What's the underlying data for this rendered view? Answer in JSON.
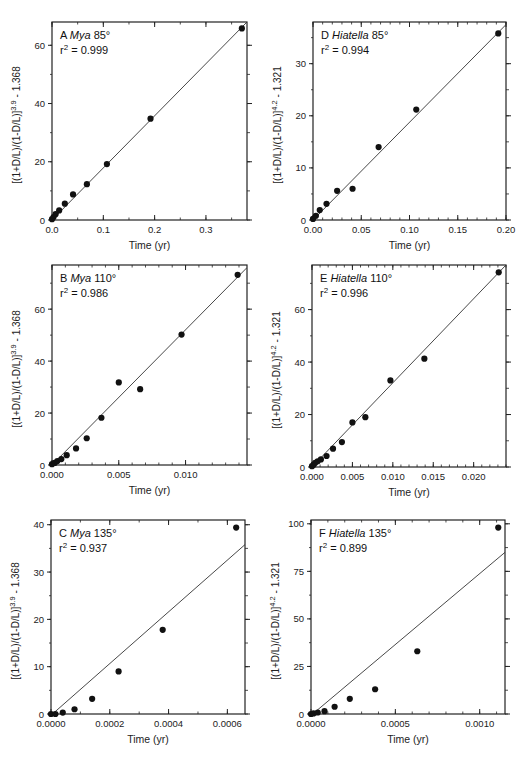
{
  "figure": {
    "x_axis_title": "Time (yr)"
  },
  "chart_data": [
    {
      "type": "scatter",
      "panel": "A",
      "taxon": "Mya",
      "temperature": "85°",
      "r2_text": "= 0.999",
      "ylabel_base": "[(1+D/L)/(1-D/L)]",
      "ylabel_exp": "3.9",
      "ylabel_tail": " - 1.368",
      "xlabel": "Time (yr)",
      "xlim": [
        0,
        0.38
      ],
      "ylim": [
        0,
        68
      ],
      "xticks": [
        0.0,
        0.1,
        0.2,
        0.3
      ],
      "xtick_labels": [
        "0.0",
        "0.1",
        "0.2",
        "0.3"
      ],
      "xminor": 0.05,
      "yticks": [
        0,
        20,
        40,
        60
      ],
      "ytick_labels": [
        "0",
        "20",
        "40",
        "60"
      ],
      "yminor": 10,
      "x": [
        0.0,
        0.003,
        0.007,
        0.014,
        0.025,
        0.041,
        0.068,
        0.107,
        0.192,
        0.37
      ],
      "y": [
        0.3,
        1.0,
        2.0,
        3.3,
        5.6,
        8.8,
        12.3,
        19.2,
        34.8,
        65.8
      ],
      "fit": {
        "x": [
          0,
          0.38
        ],
        "y": [
          0,
          68
        ]
      },
      "box": {
        "left": 52,
        "top": 22,
        "right": 247,
        "bottom": 220
      }
    },
    {
      "type": "scatter",
      "panel": "D",
      "taxon": "Hiatella",
      "temperature": "85°",
      "r2_text": "= 0.994",
      "ylabel_base": "[(1+D/L)/(1-D/L)]",
      "ylabel_exp": "4.2",
      "ylabel_tail": " - 1.321",
      "xlabel": "Time (yr)",
      "xlim": [
        0,
        0.2
      ],
      "ylim": [
        0,
        38
      ],
      "xticks": [
        0.0,
        0.05,
        0.1,
        0.15,
        0.2
      ],
      "xtick_labels": [
        "0.00",
        "0.05",
        "0.10",
        "0.15",
        "0.20"
      ],
      "xminor": 0.01,
      "yticks": [
        0,
        10,
        20,
        30
      ],
      "ytick_labels": [
        "0",
        "10",
        "20",
        "30"
      ],
      "yminor": 5,
      "x": [
        0.0,
        0.003,
        0.007,
        0.014,
        0.025,
        0.041,
        0.068,
        0.107,
        0.192
      ],
      "y": [
        0.2,
        0.8,
        1.9,
        3.1,
        5.6,
        6.0,
        14.0,
        21.2,
        35.8
      ],
      "fit": {
        "x": [
          0,
          0.2
        ],
        "y": [
          0,
          37.5
        ]
      },
      "box": {
        "left": 313,
        "top": 22,
        "right": 506,
        "bottom": 220
      }
    },
    {
      "type": "scatter",
      "panel": "B",
      "taxon": "Mya",
      "temperature": "110°",
      "r2_text": "= 0.986",
      "ylabel_base": "[(1+D/L)/(1-D/L)]",
      "ylabel_exp": "3.9",
      "ylabel_tail": " - 1.368",
      "xlabel": "Time (yr)",
      "xlim": [
        0,
        0.0146
      ],
      "ylim": [
        0,
        77
      ],
      "xticks": [
        0.0,
        0.005,
        0.01
      ],
      "xtick_labels": [
        "0.000",
        "0.005",
        "0.010"
      ],
      "xminor": 0.001,
      "yticks": [
        0,
        20,
        40,
        60
      ],
      "ytick_labels": [
        "0",
        "20",
        "40",
        "60"
      ],
      "yminor": 10,
      "x": [
        0.0,
        0.0002,
        0.0004,
        0.0007,
        0.0011,
        0.0018,
        0.0026,
        0.0037,
        0.005,
        0.0066,
        0.0097,
        0.0139
      ],
      "y": [
        0.3,
        0.8,
        1.5,
        2.3,
        3.8,
        6.4,
        10.3,
        18.2,
        31.8,
        29.2,
        50.2,
        73.2
      ],
      "fit": {
        "x": [
          0,
          0.0146
        ],
        "y": [
          0,
          76
        ]
      },
      "box": {
        "left": 52,
        "top": 265,
        "right": 247,
        "bottom": 465
      }
    },
    {
      "type": "scatter",
      "panel": "E",
      "taxon": "Hiatella",
      "temperature": "110°",
      "r2_text": "= 0.996",
      "ylabel_base": "[(1+D/L)/(1-D/L)]",
      "ylabel_exp": "4.2",
      "ylabel_tail": " - 1.321",
      "xlabel": "Time (yr)",
      "xlim": [
        0,
        0.024
      ],
      "ylim": [
        0,
        77
      ],
      "xticks": [
        0.0,
        0.005,
        0.01,
        0.015,
        0.02
      ],
      "xtick_labels": [
        "0.000",
        "0.005",
        "0.010",
        "0.015",
        "0.020"
      ],
      "xminor": 0.001,
      "yticks": [
        0,
        20,
        40,
        60
      ],
      "ytick_labels": [
        "0",
        "20",
        "40",
        "60"
      ],
      "yminor": 10,
      "x": [
        0.0,
        0.0002,
        0.0004,
        0.0007,
        0.0011,
        0.0018,
        0.0026,
        0.0037,
        0.005,
        0.0066,
        0.0097,
        0.0139,
        0.0231
      ],
      "y": [
        0.3,
        0.9,
        1.6,
        2.2,
        2.9,
        4.2,
        7.0,
        9.5,
        17.0,
        19.0,
        33.0,
        41.3,
        74.2
      ],
      "fit": {
        "x": [
          0,
          0.024
        ],
        "y": [
          0,
          77
        ]
      },
      "box": {
        "left": 312,
        "top": 265,
        "right": 506,
        "bottom": 467
      }
    },
    {
      "type": "scatter",
      "panel": "C",
      "taxon": "Mya",
      "temperature": "135°",
      "r2_text": "= 0.937",
      "ylabel_base": "[(1+D/L)/(1-D/L)]",
      "ylabel_exp": "3.9",
      "ylabel_tail": " - 1.368",
      "xlabel": "Time (yr)",
      "xlim": [
        0,
        0.00066
      ],
      "ylim": [
        0,
        41
      ],
      "xticks": [
        0.0,
        0.0002,
        0.0004,
        0.0006
      ],
      "xtick_labels": [
        "0.0000",
        "0.0002",
        "0.0004",
        "0.0006"
      ],
      "xminor": 0.0001,
      "yticks": [
        0,
        10,
        20,
        30,
        40
      ],
      "ytick_labels": [
        "0",
        "10",
        "20",
        "30",
        "40"
      ],
      "yminor": 5,
      "x": [
        0.0,
        1.5e-05,
        4e-05,
        8e-05,
        0.00014,
        0.00023,
        0.00038,
        0.00063
      ],
      "y": [
        0.0,
        0.0,
        0.3,
        1.0,
        3.2,
        9.0,
        17.8,
        39.4
      ],
      "fit": {
        "x": [
          5e-06,
          0.00066
        ],
        "y": [
          0,
          35.8
        ]
      },
      "box": {
        "left": 51,
        "top": 520,
        "right": 245,
        "bottom": 714
      }
    },
    {
      "type": "scatter",
      "panel": "F",
      "taxon": "Hiatella",
      "temperature": "135°",
      "r2_text": "= 0.899",
      "ylabel_base": "[(1+D/L)/(1-D/L)]",
      "ylabel_exp": "4.2",
      "ylabel_tail": " - 1.321",
      "xlabel": "Time (yr)",
      "xlim": [
        0,
        0.00115
      ],
      "ylim": [
        0,
        102
      ],
      "xticks": [
        0.0,
        0.0005,
        0.001
      ],
      "xtick_labels": [
        "0.0000",
        "0.0005",
        "0.0010"
      ],
      "xminor": 0.0001,
      "yticks": [
        0,
        25,
        50,
        75,
        100
      ],
      "ytick_labels": [
        "0",
        "25",
        "50",
        "75",
        "100"
      ],
      "yminor": 12.5,
      "x": [
        0.0,
        1.5e-05,
        4e-05,
        8e-05,
        0.00014,
        0.00023,
        0.00038,
        0.00063,
        0.00111
      ],
      "y": [
        0.0,
        0.3,
        0.8,
        1.5,
        3.8,
        8.0,
        13.0,
        33.0,
        98.0
      ],
      "fit": {
        "x": [
          1e-05,
          0.00115
        ],
        "y": [
          0,
          85
        ]
      },
      "box": {
        "left": 311,
        "top": 520,
        "right": 505,
        "bottom": 714
      }
    }
  ]
}
